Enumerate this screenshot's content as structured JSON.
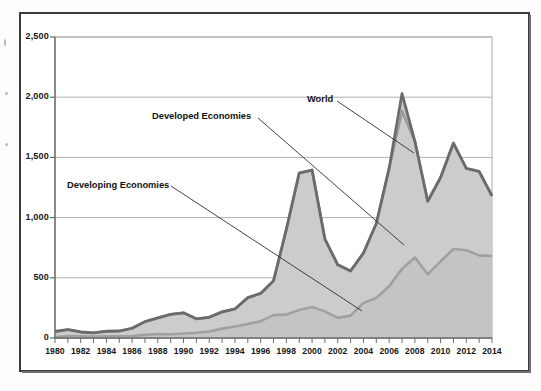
{
  "figure": {
    "frame_color": "#3a3a3a",
    "background": "#ffffff"
  },
  "annotations": {
    "world": "World",
    "developed": "Developed Economies",
    "developing": "Developing Economies"
  },
  "axis": {
    "y_ticks": [
      "0",
      "500",
      "1,000",
      "1,500",
      "2,000",
      "2,500"
    ],
    "x_ticks": [
      "1980",
      "1982",
      "1984",
      "1986",
      "1988",
      "1990",
      "1992",
      "1994",
      "1996",
      "1998",
      "2000",
      "2002",
      "2004",
      "2006",
      "2008",
      "2010",
      "2012",
      "2014"
    ]
  },
  "chart_data": {
    "type": "area",
    "title": "",
    "subtitle": "",
    "xlabel": "",
    "ylabel": "",
    "ylim": [
      0,
      2500
    ],
    "xlim": [
      1980,
      2014
    ],
    "grid": true,
    "legend_position": "inline-annotations",
    "y_tick_values": [
      0,
      500,
      1000,
      1500,
      2000,
      2500
    ],
    "x": [
      1980,
      1981,
      1982,
      1983,
      1984,
      1985,
      1986,
      1987,
      1988,
      1989,
      1990,
      1991,
      1992,
      1993,
      1994,
      1995,
      1996,
      1997,
      1998,
      1999,
      2000,
      2001,
      2002,
      2003,
      2004,
      2005,
      2006,
      2007,
      2008,
      2009,
      2010,
      2011,
      2012,
      2013,
      2014
    ],
    "series": [
      {
        "name": "Developing Economies",
        "color": "#9f9f9f",
        "fill": "#c9c9c9",
        "stack_order": 1,
        "values": [
          8,
          17,
          14,
          13,
          14,
          14,
          16,
          26,
          33,
          31,
          37,
          44,
          54,
          78,
          96,
          116,
          140,
          190,
          194,
          232,
          257,
          221,
          167,
          186,
          292,
          332,
          430,
          574,
          669,
          530,
          637,
          739,
          729,
          686,
          681
        ]
      },
      {
        "name": "Developed Economies",
        "color": "#8d8d8d",
        "fill": "#cfcfcf",
        "stack_order": 2,
        "values": [
          46,
          53,
          36,
          30,
          42,
          44,
          65,
          110,
          134,
          166,
          172,
          115,
          118,
          139,
          145,
          219,
          230,
          285,
          708,
          1138,
          1138,
          601,
          441,
          371,
          414,
          619,
          981,
          1310,
          965,
          606,
          696,
          880,
          679,
          697,
          499
        ]
      },
      {
        "name": "World",
        "color": "#6d6d6d",
        "is_total_line": true,
        "stack_order": 3,
        "values": [
          54,
          70,
          50,
          43,
          56,
          58,
          81,
          136,
          167,
          197,
          209,
          159,
          172,
          217,
          241,
          335,
          370,
          475,
          902,
          1370,
          1395,
          822,
          608,
          557,
          706,
          951,
          1411,
          2030,
          1634,
          1136,
          1333,
          1619,
          1408,
          1383,
          1180
        ]
      }
    ]
  }
}
